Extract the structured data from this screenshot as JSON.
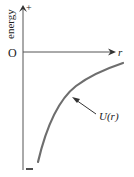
{
  "diagram": {
    "y_axis": {
      "label": "energy",
      "positive_sign": "+",
      "negative_sign": "−"
    },
    "x_axis": {
      "label": "r",
      "origin_label": "O"
    },
    "curve": {
      "label": "U(r)",
      "description": "Potential energy curve rising from large negative values toward zero as r increases"
    },
    "colors": {
      "axis": "#555555",
      "curve": "#6e6e6e",
      "text": "#222222"
    }
  }
}
